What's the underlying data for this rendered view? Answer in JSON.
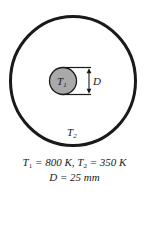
{
  "diagram": {
    "outer_circle": {
      "label": "T",
      "label_sub": "2",
      "stroke": "#1a1a1a"
    },
    "inner_cylinder": {
      "label": "T",
      "label_sub": "1",
      "fill": "#a9a9a9",
      "stroke": "#1a1a1a"
    },
    "dimension": {
      "label": "D"
    }
  },
  "caption": {
    "line1": {
      "t1_sym": "T",
      "t1_sub": "1",
      "t1_val": " = 800 K, ",
      "t2_sym": "T",
      "t2_sub": "2",
      "t2_val": " = 350 K"
    },
    "line2": "D = 25 mm"
  }
}
